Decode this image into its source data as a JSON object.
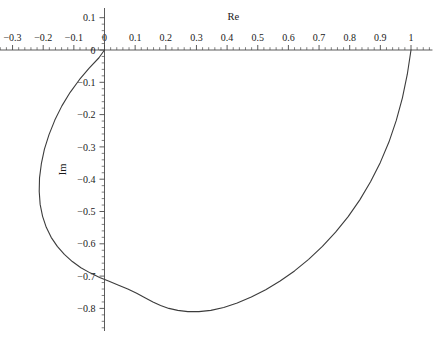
{
  "chart_data": {
    "type": "line",
    "title": "",
    "xlabel": "Re",
    "ylabel": "Im",
    "xlim": [
      -0.35,
      1.07
    ],
    "ylim": [
      -0.87,
      0.13
    ],
    "grid": false,
    "legend": null,
    "xticks": [
      -0.3,
      -0.2,
      -0.1,
      0,
      0.1,
      0.2,
      0.3,
      0.4,
      0.5,
      0.6,
      0.7,
      0.8,
      0.9,
      1
    ],
    "xticklabels": [
      "-0.3",
      "-0.2",
      "-0.1",
      "0",
      "0.1",
      "0.2",
      "0.3",
      "0.4",
      "0.5",
      "0.6",
      "0.7",
      "0.8",
      "0.9",
      "1"
    ],
    "yticks": [
      0.1,
      0,
      -0.1,
      -0.2,
      -0.3,
      -0.4,
      -0.5,
      -0.6,
      -0.7,
      -0.8
    ],
    "yticklabels": [
      "0.1",
      "0",
      "-0.1",
      "-0.2",
      "-0.3",
      "-0.4",
      "-0.5",
      "-0.6",
      "-0.7",
      "-0.8"
    ],
    "minor_ticks_per_interval": 4,
    "line_color": "#3c3c3c",
    "line_width": 1.1,
    "series": [
      {
        "name": "locus",
        "x": [
          1.0,
          0.988,
          0.972,
          0.952,
          0.928,
          0.9,
          0.868,
          0.833,
          0.795,
          0.754,
          0.711,
          0.666,
          0.62,
          0.573,
          0.526,
          0.479,
          0.433,
          0.389,
          0.347,
          0.308,
          0.272,
          0.239,
          0.21,
          0.183,
          0.158,
          0.132,
          0.105,
          0.076,
          0.046,
          0.015,
          -0.016,
          -0.047,
          -0.077,
          -0.105,
          -0.131,
          -0.154,
          -0.174,
          -0.19,
          -0.202,
          -0.21,
          -0.213,
          -0.212,
          -0.206,
          -0.196,
          -0.181,
          -0.162,
          -0.139,
          -0.112,
          -0.082,
          -0.05,
          -0.018,
          0.0
        ],
        "y": [
          0.0,
          -0.075,
          -0.148,
          -0.218,
          -0.285,
          -0.348,
          -0.408,
          -0.464,
          -0.516,
          -0.564,
          -0.608,
          -0.648,
          -0.684,
          -0.715,
          -0.742,
          -0.765,
          -0.783,
          -0.797,
          -0.806,
          -0.81,
          -0.81,
          -0.806,
          -0.8,
          -0.791,
          -0.78,
          -0.767,
          -0.753,
          -0.74,
          -0.728,
          -0.716,
          -0.704,
          -0.69,
          -0.674,
          -0.655,
          -0.633,
          -0.608,
          -0.58,
          -0.549,
          -0.515,
          -0.478,
          -0.438,
          -0.396,
          -0.352,
          -0.307,
          -0.262,
          -0.217,
          -0.173,
          -0.131,
          -0.092,
          -0.056,
          -0.024,
          0.0
        ]
      }
    ],
    "annotations": []
  },
  "axes": {
    "x_axis_name": "real-axis",
    "y_axis_name": "imaginary-axis"
  }
}
